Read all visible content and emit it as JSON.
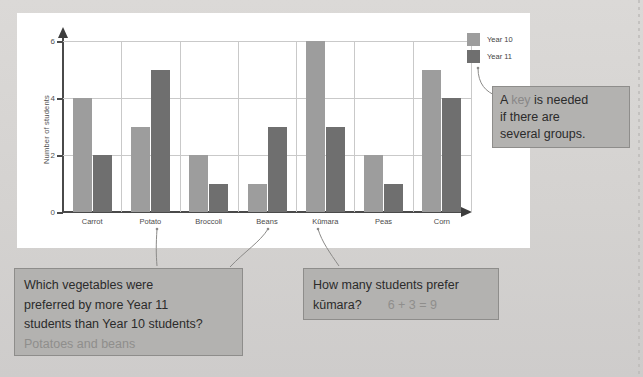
{
  "chart_data": {
    "type": "bar",
    "title": "",
    "xlabel": "",
    "ylabel": "Number of students",
    "categories": [
      "Carrot",
      "Potato",
      "Broccoli",
      "Beans",
      "Kūmara",
      "Peas",
      "Corn"
    ],
    "series": [
      {
        "name": "Year 10",
        "color": "#9d9d9d",
        "values": [
          4,
          3,
          2,
          1,
          6,
          2,
          5
        ]
      },
      {
        "name": "Year 11",
        "color": "#6f6f6f",
        "values": [
          2,
          5,
          1,
          3,
          3,
          1,
          4
        ]
      }
    ],
    "ylim": [
      0,
      6
    ],
    "yticks": [
      0,
      2,
      4,
      6
    ],
    "ytick_labels": [
      "0",
      "2",
      "4",
      "6"
    ],
    "grid": true,
    "legend_position": "top-right"
  },
  "legend": {
    "items": [
      {
        "label": "Year 10",
        "color": "#9d9d9d"
      },
      {
        "label": "Year 11",
        "color": "#6f6f6f"
      }
    ]
  },
  "callouts": {
    "key": {
      "line1_a": "A ",
      "line1_hl": "key",
      "line1_b": " is needed",
      "line2": "if there are",
      "line3": "several groups."
    },
    "left": {
      "line1": "Which vegetables were",
      "line2": "preferred by more Year 11",
      "line3": "students than Year 10 students?",
      "answer": "Potatoes and beans"
    },
    "right": {
      "line1": "How many students prefer",
      "question": "kūmara?",
      "answer": "6 + 3 = 9"
    }
  },
  "colors": {
    "page_background": "#d6d4d2",
    "panel_background": "#ffffff",
    "callout_background": "#b3b2b0",
    "callout_border": "#8e8d8b",
    "axis": "#4a4a4a",
    "gridline": "#c9c9c9",
    "answer_text": "#8f8e8c"
  }
}
